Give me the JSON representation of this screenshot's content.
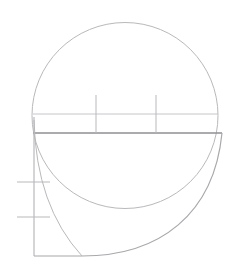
{
  "document": {
    "title": "Geometric Line Drawing",
    "background_color": "#ffffff",
    "width": 231,
    "height": 270
  },
  "palette": {
    "stroke_light": "#b9b9bd",
    "stroke_medium": "#a8a8ad",
    "stroke_dark": "#8e8e94",
    "stroke_faint": "#c6c6ca"
  },
  "chart_data": {
    "type": "line",
    "xlabel": "",
    "ylabel": "",
    "xlim": [
      0,
      231
    ],
    "ylim": [
      0,
      270
    ],
    "grid": false,
    "legend": null,
    "annotations": [],
    "tick_labels": {
      "x": [],
      "y": []
    },
    "series": [
      {
        "name": "circle-outline",
        "kind": "circle",
        "center": [
          125,
          115.5
        ],
        "radius": 93,
        "stroke": "#b9b9bd",
        "stroke_width": 1
      },
      {
        "name": "upper-chord-line",
        "kind": "segment",
        "x": [
          33,
          218
        ],
        "y": [
          114,
          114
        ],
        "stroke": "#c6c6ca",
        "stroke_width": 1
      },
      {
        "name": "lower-chord-line",
        "kind": "segment",
        "x": [
          33,
          222
        ],
        "y": [
          133,
          133
        ],
        "stroke": "#8e8e94",
        "stroke_width": 1.4
      },
      {
        "name": "left-vertical-axis",
        "kind": "segment",
        "x": [
          34,
          34
        ],
        "y": [
          117,
          256
        ],
        "stroke": "#b9b9bd",
        "stroke_width": 1.2
      },
      {
        "name": "bottom-horizontal-segment",
        "kind": "segment",
        "x": [
          34,
          82
        ],
        "y": [
          256,
          256
        ],
        "stroke": "#a8a8ad",
        "stroke_width": 1.2
      },
      {
        "name": "vertical-tick-left",
        "kind": "segment",
        "x": [
          96,
          96
        ],
        "y": [
          95,
          133
        ],
        "stroke": "#b9b9bd",
        "stroke_width": 1
      },
      {
        "name": "vertical-tick-right",
        "kind": "segment",
        "x": [
          156,
          156
        ],
        "y": [
          95,
          133
        ],
        "stroke": "#b9b9bd",
        "stroke_width": 1
      },
      {
        "name": "horizontal-tick-upper",
        "kind": "segment",
        "x": [
          17,
          50
        ],
        "y": [
          182,
          182
        ],
        "stroke": "#b9b9bd",
        "stroke_width": 1.2
      },
      {
        "name": "horizontal-tick-lower",
        "kind": "segment",
        "x": [
          17,
          50
        ],
        "y": [
          217,
          217
        ],
        "stroke": "#b9b9bd",
        "stroke_width": 1.2
      },
      {
        "name": "inner-tangent-arc",
        "kind": "curve",
        "start": [
          34,
          120
        ],
        "end": [
          82,
          256
        ],
        "control": [
          36,
          206
        ],
        "stroke": "#b9b9bd",
        "stroke_width": 1
      },
      {
        "name": "sweeping-outer-arc",
        "kind": "curve",
        "start": [
          222,
          133
        ],
        "end": [
          82,
          256
        ],
        "control1": [
          214,
          214
        ],
        "control2": [
          160,
          256
        ],
        "stroke": "#a8a8ad",
        "stroke_width": 1.2
      }
    ]
  }
}
